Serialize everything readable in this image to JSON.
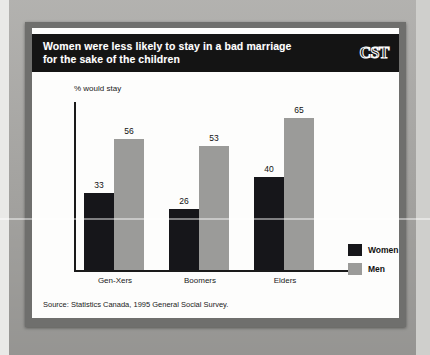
{
  "header": {
    "title_line1": "Women were less likely to stay in a bad marriage",
    "title_line2": "for the sake of the children",
    "logo": "CST"
  },
  "source": "Source: Statistics Canada, 1995 General Social Survey.",
  "legend": {
    "items": [
      {
        "label": "Women",
        "color": "#16161a"
      },
      {
        "label": "Men",
        "color": "#9b9b99"
      }
    ]
  },
  "chart_data": {
    "type": "bar",
    "title": "Women were less likely to stay in a bad marriage for the sake of the children",
    "ylabel": "% would stay",
    "xlabel": "",
    "categories": [
      "Gen-Xers",
      "Boomers",
      "Elders"
    ],
    "series": [
      {
        "name": "Women",
        "color": "#16161a",
        "values": [
          33,
          26,
          40
        ]
      },
      {
        "name": "Men",
        "color": "#9b9b99",
        "values": [
          56,
          53,
          65
        ]
      }
    ],
    "ylim": [
      0,
      72
    ],
    "grid": false,
    "legend_position": "right",
    "data_labels": true
  }
}
